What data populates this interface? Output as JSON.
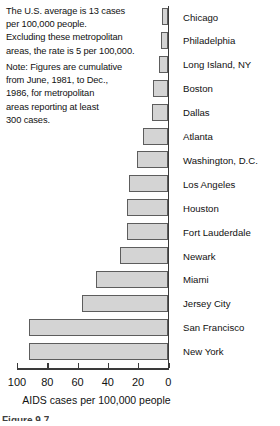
{
  "notes": {
    "note_a": [
      "The U.S. average is 13 cases",
      "per 100,000 people.",
      "Excluding these metropolitan",
      "areas, the rate is 5 per 100,000."
    ],
    "note_b": [
      "Note:  Figures are cumulative",
      "from June, 1981, to Dec.,",
      "1986, for metropolitan",
      "areas reporting at least",
      "300 cases."
    ]
  },
  "caption": "Figure 9.7",
  "chart_data": {
    "type": "bar",
    "orientation": "horizontal",
    "title": "",
    "xlabel": "AIDS cases per 100,000 people",
    "ylabel": "",
    "xlim": [
      100,
      0
    ],
    "x_axis_reversed": true,
    "grid": false,
    "legend": "none",
    "tick_labels": [
      "100",
      "80",
      "60",
      "40",
      "20",
      "0"
    ],
    "ticks": [
      100,
      80,
      60,
      40,
      20,
      0
    ],
    "categories": [
      "Chicago",
      "Philadelphia",
      "Long Island, NY",
      "Boston",
      "Dallas",
      "Atlanta",
      "Washington, D.C.",
      "Los Angeles",
      "Houston",
      "Fort Lauderdale",
      "Newark",
      "Miami",
      "Jersey City",
      "San Francisco",
      "New York"
    ],
    "values": [
      4,
      4.5,
      6,
      10,
      11,
      17,
      21,
      26,
      27,
      27,
      32,
      48,
      57,
      92,
      92
    ],
    "bar_fill": "#d4d4d4",
    "bar_stroke": "#5d5d5d"
  }
}
